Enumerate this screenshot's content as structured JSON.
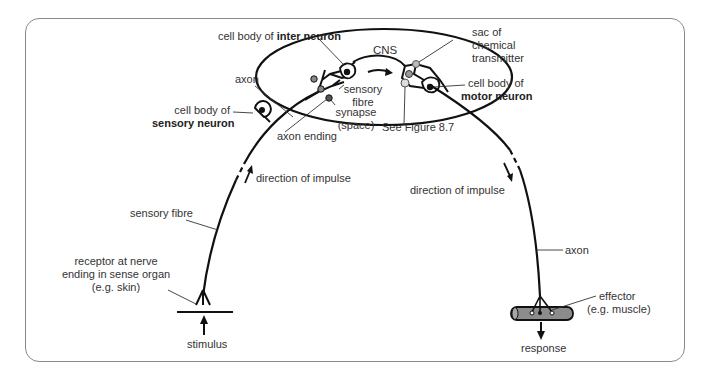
{
  "diagram": {
    "cns_label": "CNS",
    "labels": {
      "cell_body_inter_prefix": "cell body of ",
      "cell_body_inter_bold": "inter neuron",
      "axon_top": "axon",
      "cell_body_sensory_prefix": "cell body of",
      "cell_body_sensory_bold": "sensory neuron",
      "sensory_fibre_cns_1": "sensory",
      "sensory_fibre_cns_2": "fibre",
      "synapse_1": "synapse",
      "synapse_2": "(space)",
      "axon_ending": "axon ending",
      "see_figure": "See Figure 8.7",
      "sac_1": "sac of",
      "sac_2": "chemical",
      "sac_3": "transmitter",
      "cell_body_motor_prefix": "cell body of",
      "cell_body_motor_bold": "motor neuron",
      "direction_left": "direction of impulse",
      "direction_right": "direction of impulse",
      "sensory_fibre": "sensory fibre",
      "receptor_1": "receptor at nerve",
      "receptor_2": "ending in sense organ",
      "receptor_3": "(e.g. skin)",
      "stimulus": "stimulus",
      "axon_right": "axon",
      "effector_1": "effector",
      "effector_2": "(e.g. muscle)",
      "response": "response"
    },
    "colors": {
      "line": "#111111",
      "frame": "#8a8a8a",
      "muscle_fill": "#8c8c8c",
      "sac_fill": "#bdbdbd"
    }
  }
}
